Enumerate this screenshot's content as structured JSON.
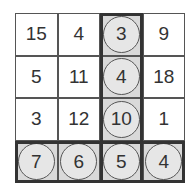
{
  "grid": {
    "rows": 4,
    "cols": 4,
    "cells": [
      [
        {
          "v": "15",
          "hl": false
        },
        {
          "v": "4",
          "hl": false
        },
        {
          "v": "3",
          "hl": true
        },
        {
          "v": "9",
          "hl": false
        }
      ],
      [
        {
          "v": "5",
          "hl": false
        },
        {
          "v": "11",
          "hl": false
        },
        {
          "v": "4",
          "hl": true
        },
        {
          "v": "18",
          "hl": false
        }
      ],
      [
        {
          "v": "3",
          "hl": false
        },
        {
          "v": "12",
          "hl": false
        },
        {
          "v": "10",
          "hl": true
        },
        {
          "v": "1",
          "hl": false
        }
      ],
      [
        {
          "v": "7",
          "hl": true
        },
        {
          "v": "6",
          "hl": true
        },
        {
          "v": "5",
          "hl": true
        },
        {
          "v": "4",
          "hl": true
        }
      ]
    ],
    "highlighted_column_index": 2,
    "highlighted_row_index": 3,
    "colors": {
      "highlight_fill": "#d9d9d9",
      "circle_fill": "#e6e6e6",
      "border": "#333333"
    }
  }
}
